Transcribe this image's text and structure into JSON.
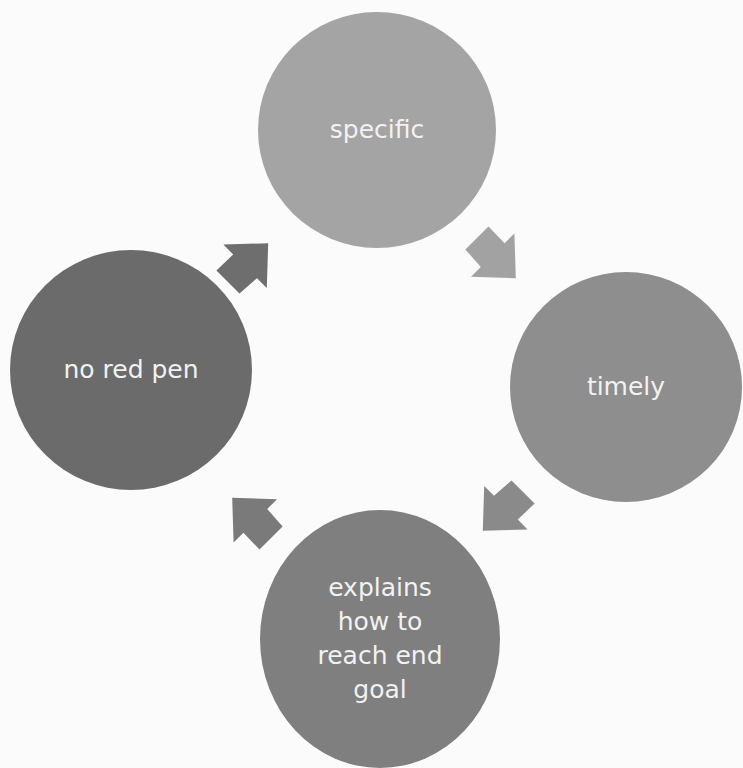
{
  "diagram": {
    "type": "cycle",
    "nodes": [
      {
        "id": "specific",
        "label": "specific",
        "color": "#a4a4a4"
      },
      {
        "id": "timely",
        "label": "timely",
        "color": "#8e8e8e"
      },
      {
        "id": "end-goal",
        "label": "explains\nhow to\nreach end\ngoal",
        "color": "#7f7f7f"
      },
      {
        "id": "no-red-pen",
        "label": "no red pen",
        "color": "#6b6b6b"
      }
    ],
    "arrows": [
      {
        "from": "specific",
        "to": "timely",
        "color": "#a2a2a2"
      },
      {
        "from": "timely",
        "to": "end-goal",
        "color": "#8a8a8a"
      },
      {
        "from": "end-goal",
        "to": "no-red-pen",
        "color": "#7a7a7a"
      },
      {
        "from": "no-red-pen",
        "to": "specific",
        "color": "#6e6e6e"
      }
    ]
  }
}
